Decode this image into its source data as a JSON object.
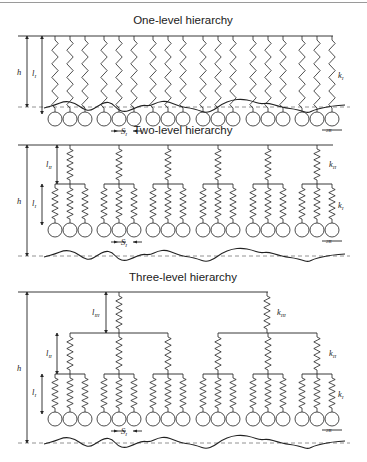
{
  "colors": {
    "stroke": "#222222",
    "dashed": "#777777",
    "background": "#ffffff"
  },
  "panels": [
    {
      "title": "One-level hierarchy",
      "title_y": 24,
      "top_y": 36,
      "level_bars_y": [],
      "circle_y": 119,
      "ground_y": 107,
      "levels": 1,
      "h_label": "h",
      "labels": {
        "l": [
          "l",
          "I"
        ],
        "k": [
          "k",
          "I"
        ]
      }
    },
    {
      "title": "Two-level hierarchy",
      "title_y": 134,
      "top_y": 145,
      "level_bars_y": [
        184
      ],
      "circle_y": 230,
      "ground_y": 256,
      "levels": 2,
      "h_label": "h",
      "labels": {
        "l": [
          "l",
          "II"
        ],
        "k": [
          "k",
          "II"
        ]
      }
    },
    {
      "title": "Three-level hierarchy",
      "title_y": 281,
      "top_y": 292,
      "level_bars_y": [
        333,
        374
      ],
      "circle_y": 419,
      "ground_y": 443,
      "levels": 3,
      "h_label": "h",
      "labels": {
        "l": [
          "l",
          "III"
        ],
        "k": [
          "k",
          "III"
        ]
      }
    }
  ],
  "symbols": {
    "h": "h",
    "l_I": "l",
    "l_I_sub": "I",
    "l_II": "l",
    "l_II_sub": "II",
    "l_III": "l",
    "l_III_sub": "III",
    "k_I": "k",
    "k_I_sub": "I",
    "k_II": "k",
    "k_II_sub": "II",
    "k_III": "k",
    "k_III_sub": "III",
    "S_I": "S",
    "S_I_sub": "I",
    "two_R": "2R"
  },
  "geometry": {
    "group_centers_x": [
      70,
      119,
      168,
      218,
      268,
      317
    ],
    "spring_offset": 15,
    "group_count_level1": 5,
    "level3_centers_x": [
      119,
      267
    ],
    "circle_r": 7
  }
}
